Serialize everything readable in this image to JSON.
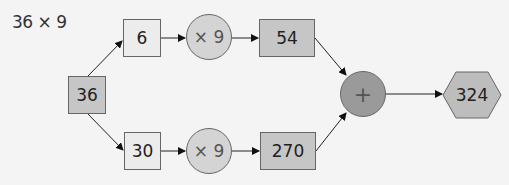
{
  "title": "36 × 9",
  "nodes": {
    "start": "36",
    "top_part": "6",
    "bottom_part": "30",
    "top_op": "× 9",
    "bottom_op": "× 9",
    "top_result": "54",
    "bottom_result": "270",
    "sum_op": "+",
    "final": "324"
  },
  "colors": {
    "background": "#f4f4f4",
    "light_box": "#ececec",
    "result_box": "#c6c6c6",
    "circle": "#d4d4d4",
    "sum_circle": "#9a9a9a",
    "hexagon": "#bdbdbd"
  }
}
